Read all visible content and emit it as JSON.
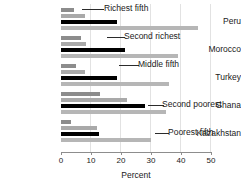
{
  "chart_data": {
    "type": "bar",
    "orientation": "horizontal",
    "title": "",
    "xlabel": "Percent",
    "ylabel": "",
    "xlim": [
      0,
      50
    ],
    "xticks": [
      0,
      10,
      20,
      30,
      40,
      50
    ],
    "grid": true,
    "legend_position": "annotations-inline",
    "categories": [
      "Peru",
      "Morocco",
      "Turkey",
      "Ghana",
      "Kazakhstan"
    ],
    "series": [
      {
        "name": "Poorest fifth",
        "color": "#8c8c8c",
        "values": [
          4.4,
          6.5,
          4.9,
          13.0,
          3.4
        ]
      },
      {
        "name": "Second poorest",
        "color": "#a9a9a9",
        "values": [
          8.0,
          8.4,
          8.0,
          22.0,
          12.0
        ]
      },
      {
        "name": "Middle fifth",
        "color": "#000000",
        "values": [
          18.6,
          21.3,
          18.7,
          28.0,
          12.5
        ]
      },
      {
        "name": "Second richest",
        "color": "#b6b6b6",
        "values": [
          45.5,
          39.0,
          36.0,
          35.0,
          30.0
        ]
      }
    ],
    "annotations": [
      {
        "label": "Richest fifth",
        "group": "Peru"
      },
      {
        "label": "Second richest",
        "group": "Morocco"
      },
      {
        "label": "Middle fifth",
        "group": "Turkey"
      },
      {
        "label": "Second poorest",
        "group": "Ghana"
      },
      {
        "label": "Poorest fifth",
        "group": "Kazakhstan"
      }
    ]
  },
  "axis": {
    "tick_labels": [
      "0",
      "10",
      "20",
      "30",
      "40",
      "50"
    ],
    "title": "Percent"
  },
  "countries": {
    "peru": "Peru",
    "morocco": "Morocco",
    "turkey": "Turkey",
    "ghana": "Ghana",
    "kazakhstan": "Kazakhstan"
  },
  "annotations": {
    "richest": "Richest fifth",
    "second_richest": "Second richest",
    "middle": "Middle fifth",
    "second_poorest": "Second poorest",
    "poorest": "Poorest fifth"
  }
}
